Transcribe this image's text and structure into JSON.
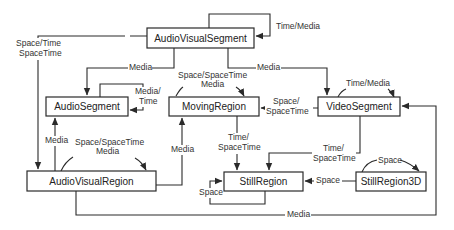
{
  "diagram": {
    "colors": {
      "line": "#2a2a2a",
      "text": "#333333",
      "background": "#ffffff"
    },
    "nodes": [
      {
        "id": "avs",
        "label": "AudioVisualSegment"
      },
      {
        "id": "as",
        "label": "AudioSegment"
      },
      {
        "id": "mr",
        "label": "MovingRegion"
      },
      {
        "id": "vs",
        "label": "VideoSegment"
      },
      {
        "id": "avr",
        "label": "AudioVisualRegion"
      },
      {
        "id": "sr",
        "label": "StillRegion"
      },
      {
        "id": "sr3d",
        "label": "StillRegion3D"
      }
    ],
    "edges": [
      {
        "from": "avs",
        "to": "avs",
        "label": "Time/Media"
      },
      {
        "from": "avs",
        "to": "avr",
        "label_line1": "Space/Time",
        "label_line2": "SpaceTime"
      },
      {
        "from": "avs",
        "to": "as",
        "label": "Media"
      },
      {
        "from": "avs",
        "to": "vs",
        "label": "Media"
      },
      {
        "from": "as",
        "to": "as",
        "label_line1": "Media/",
        "label_line2": "Time"
      },
      {
        "from": "mr",
        "to": "mr",
        "label_line1": "Space/SpaceTime",
        "label_line2": "Media"
      },
      {
        "from": "vs",
        "to": "mr",
        "label_line1": "Space/",
        "label_line2": "SpaceTime"
      },
      {
        "from": "vs",
        "to": "vs",
        "label": "Time/Media"
      },
      {
        "from": "avr",
        "to": "as",
        "label": "Media"
      },
      {
        "from": "avr",
        "to": "avr",
        "label_line1": "Space/SpaceTime",
        "label_line2": "Media"
      },
      {
        "from": "avr",
        "to": "mr",
        "label": "Media"
      },
      {
        "from": "mr",
        "to": "sr",
        "label_line1": "Time/",
        "label_line2": "SpaceTime"
      },
      {
        "from": "vs",
        "to": "sr",
        "label_line1": "Time/",
        "label_line2": "SpaceTime"
      },
      {
        "from": "sr",
        "to": "sr",
        "label": "Space"
      },
      {
        "from": "sr3d",
        "to": "sr",
        "label": "Space"
      },
      {
        "from": "sr3d",
        "to": "sr3d",
        "label": "Space"
      },
      {
        "from": "avr",
        "to": "vs",
        "label": "Media"
      }
    ]
  }
}
